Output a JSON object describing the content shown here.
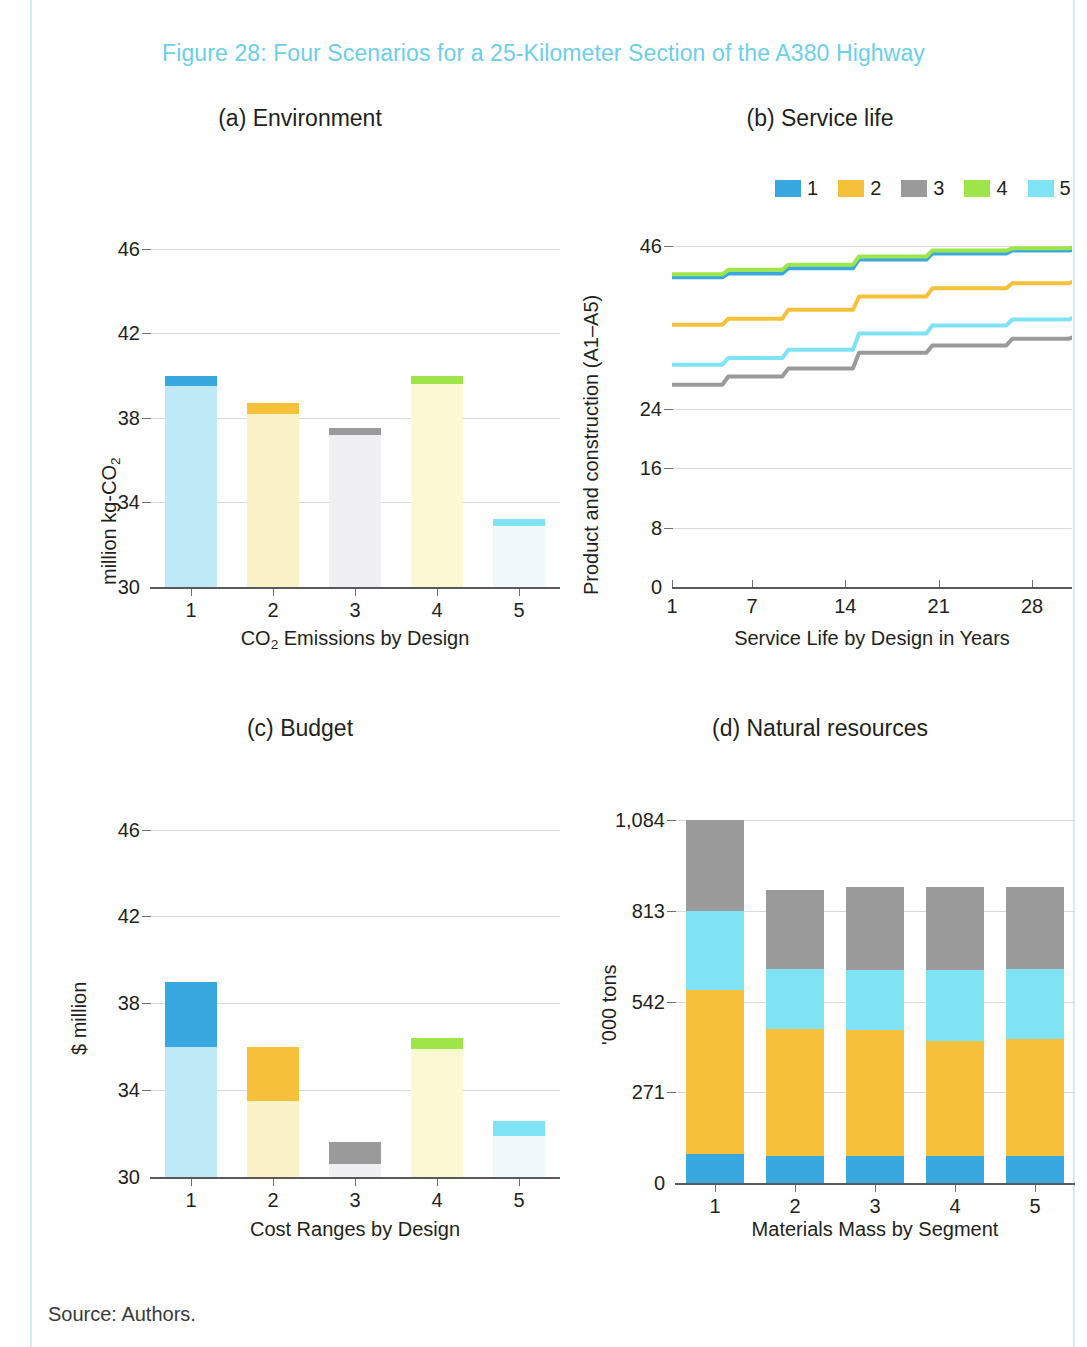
{
  "figure": {
    "title": "Figure 28: Four Scenarios for a 25-Kilometer Section of the A380 Highway",
    "title_color": "#6ccfe8",
    "source": "Source: Authors."
  },
  "palette": {
    "blue": "#3aa8e0",
    "orange": "#f5c13a",
    "gray": "#9a9a9a",
    "green": "#9de549",
    "cyan": "#7fe3f5",
    "blue_pale": "#bfe9f7",
    "orange_pale": "#fbf3c8",
    "gray_pale": "#f0f0f2",
    "green_pale": "#fbf8d4",
    "cyan_pale": "#f0fafd",
    "grid": "#d9d9d9",
    "axis": "#58595b"
  },
  "chart_data": [
    {
      "id": "a",
      "type": "bar",
      "title": "(a) Environment",
      "xlabel": "CO2 Emissions by Design",
      "xlabel_parts": [
        "CO",
        "2",
        " Emissions by Design"
      ],
      "ylabel": "million kg-CO2",
      "ylabel_parts": [
        "million kg-CO",
        "2"
      ],
      "categories": [
        "1",
        "2",
        "3",
        "4",
        "5"
      ],
      "yticks": [
        30,
        34,
        38,
        42,
        46
      ],
      "ylim": [
        30,
        47.5
      ],
      "grid": true,
      "legend": "none",
      "note": "Floating range bars: pale body from base to range_low, saturated cap band from range_low to range_high",
      "series": [
        {
          "name": "1",
          "color": "blue",
          "base": 30,
          "range_low": 39.5,
          "range_high": 40.0
        },
        {
          "name": "2",
          "color": "orange",
          "base": 30,
          "range_low": 38.2,
          "range_high": 38.7
        },
        {
          "name": "3",
          "color": "gray",
          "base": 30,
          "range_low": 37.2,
          "range_high": 37.5
        },
        {
          "name": "4",
          "color": "green",
          "base": 30,
          "range_low": 39.6,
          "range_high": 40.0
        },
        {
          "name": "5",
          "color": "cyan",
          "base": 30,
          "range_low": 32.9,
          "range_high": 33.2
        }
      ]
    },
    {
      "id": "b",
      "type": "line",
      "title": "(b) Service life",
      "xlabel": "Service Life by Design in Years",
      "ylabel": "Product and construction (A1–A5)",
      "yticks": [
        0,
        8,
        16,
        24,
        46
      ],
      "ylim": [
        0,
        47.5
      ],
      "xticks": [
        1,
        7,
        14,
        21,
        28
      ],
      "xlim": [
        1,
        31
      ],
      "grid": true,
      "legend": "top-right",
      "legend_entries": [
        "1",
        "2",
        "3",
        "4",
        "5"
      ],
      "x": [
        1,
        5,
        9.5,
        14.8,
        20.3,
        26.3,
        31
      ],
      "series": [
        {
          "name": "1",
          "color": "blue",
          "values": [
            41.8,
            42.3,
            43.0,
            44.2,
            45.0,
            45.4,
            45.6
          ]
        },
        {
          "name": "2",
          "color": "orange",
          "values": [
            35.4,
            36.2,
            37.4,
            39.2,
            40.3,
            41.0,
            41.3
          ]
        },
        {
          "name": "3",
          "color": "gray",
          "values": [
            27.3,
            28.4,
            29.5,
            31.6,
            32.6,
            33.5,
            33.8
          ]
        },
        {
          "name": "4",
          "color": "green",
          "values": [
            42.2,
            42.8,
            43.5,
            44.6,
            45.4,
            45.7,
            45.9
          ]
        },
        {
          "name": "5",
          "color": "cyan",
          "values": [
            30.0,
            30.9,
            32.0,
            34.2,
            35.3,
            36.1,
            36.4
          ]
        }
      ]
    },
    {
      "id": "c",
      "type": "bar",
      "title": "(c) Budget",
      "xlabel": "Cost Ranges by Design",
      "ylabel": "$ million",
      "categories": [
        "1",
        "2",
        "3",
        "4",
        "5"
      ],
      "yticks": [
        30,
        34,
        38,
        42,
        46
      ],
      "ylim": [
        30,
        47.5
      ],
      "grid": true,
      "legend": "none",
      "note": "Floating range bars: pale body from base to range_low, saturated band from range_low to range_high",
      "series": [
        {
          "name": "1",
          "color": "blue",
          "base": 30,
          "range_low": 36.0,
          "range_high": 39.0
        },
        {
          "name": "2",
          "color": "orange",
          "base": 30,
          "range_low": 33.5,
          "range_high": 36.0
        },
        {
          "name": "3",
          "color": "gray",
          "base": 30,
          "range_low": 30.6,
          "range_high": 31.6
        },
        {
          "name": "4",
          "color": "green",
          "base": 30,
          "range_low": 35.9,
          "range_high": 36.4
        },
        {
          "name": "5",
          "color": "cyan",
          "base": 30,
          "range_low": 31.9,
          "range_high": 32.6
        }
      ]
    },
    {
      "id": "d",
      "type": "bar",
      "stacked": true,
      "title": "(d) Natural resources",
      "xlabel": "Materials Mass by Segment",
      "ylabel": "'000 tons",
      "categories": [
        "1",
        "2",
        "3",
        "4",
        "5"
      ],
      "yticks": [
        0,
        271,
        542,
        813,
        1084
      ],
      "ytick_labels": [
        "0",
        "271",
        "542",
        "813",
        "1,084"
      ],
      "ylim": [
        0,
        1084
      ],
      "grid": true,
      "legend": "none",
      "series": [
        {
          "name": "1",
          "color": "blue",
          "values": [
            88,
            82,
            82,
            80,
            82
          ]
        },
        {
          "name": "2",
          "color": "orange",
          "values": [
            488,
            377,
            375,
            345,
            348
          ]
        },
        {
          "name": "3",
          "color": "cyan",
          "values": [
            237,
            180,
            180,
            212,
            210
          ]
        },
        {
          "name": "4",
          "color": "gray",
          "values": [
            271,
            237,
            247,
            247,
            243
          ]
        }
      ],
      "totals": [
        1084,
        876,
        884,
        884,
        883
      ]
    }
  ]
}
